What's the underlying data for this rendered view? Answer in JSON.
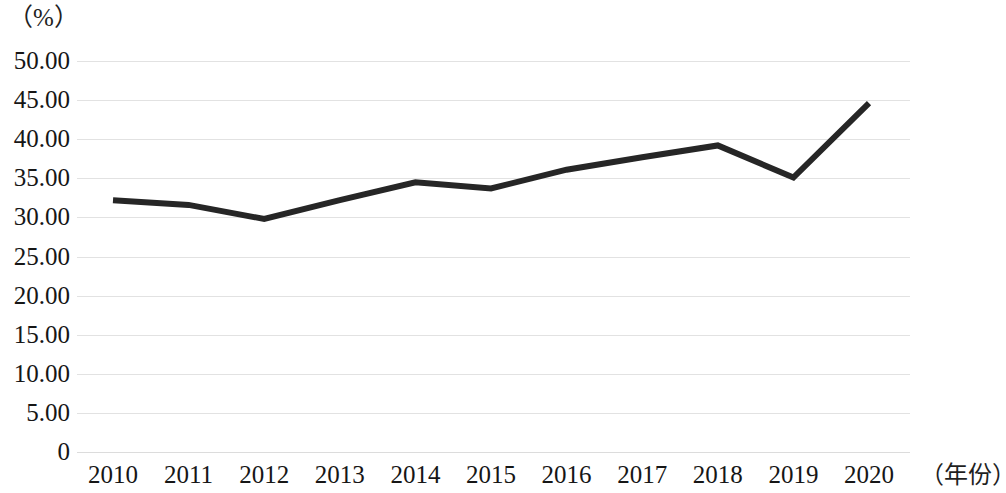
{
  "chart_data": {
    "type": "line",
    "title": "",
    "subtitle": "",
    "xlabel": "（年份）",
    "ylabel": "（%）",
    "categories": [
      "2010",
      "2011",
      "2012",
      "2013",
      "2014",
      "2015",
      "2016",
      "2017",
      "2018",
      "2019",
      "2020"
    ],
    "values": [
      32.2,
      31.6,
      29.8,
      32.2,
      34.5,
      33.7,
      36.1,
      37.7,
      39.2,
      35.1,
      44.6
    ],
    "series": [
      {
        "name": "",
        "values": [
          32.2,
          31.6,
          29.8,
          32.2,
          34.5,
          33.7,
          36.1,
          37.7,
          39.2,
          35.1,
          44.6
        ]
      }
    ],
    "y_tick_labels": [
      "50.00",
      "45.00",
      "40.00",
      "35.00",
      "30.00",
      "25.00",
      "20.00",
      "15.00",
      "10.00",
      "5.00",
      "0"
    ],
    "y_tick_values": [
      50,
      45,
      40,
      35,
      30,
      25,
      20,
      15,
      10,
      5,
      0
    ],
    "ylim": [
      0,
      50
    ],
    "xlim": [
      "2010",
      "2020"
    ],
    "grid": "horizontal",
    "legend": "none",
    "line_color": "#262626",
    "grid_color": "#e2e2e2",
    "background_color": "#ffffff",
    "markers": "none",
    "line_width": 6,
    "annotations": []
  }
}
